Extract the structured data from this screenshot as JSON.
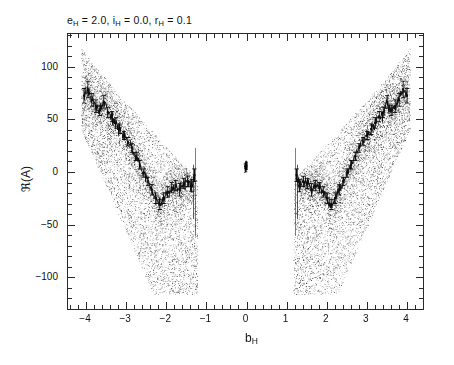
{
  "figure": {
    "title_plain": "e_H = 2.0, i_H = 0.0, r_H = 0.1",
    "background_color": "#ffffff",
    "frame_color": "#2a2a2a",
    "point_color": "#1a1a1a",
    "curve_color": "#111111"
  },
  "axes": {
    "x_title_plain": "b_H",
    "x_title_base": "b",
    "x_title_sub": "H",
    "y_title_plain": "R(A)",
    "y_title_symbol": "ℜ(A)",
    "x_ticks": [
      "-4",
      "-3",
      "-2",
      "-1",
      "0",
      "1",
      "2",
      "3",
      "4"
    ],
    "x_tick_values": [
      -4,
      -3,
      -2,
      -1,
      0,
      1,
      2,
      3,
      4
    ],
    "y_ticks": [
      "100",
      "50",
      "0",
      "-50",
      "-100"
    ],
    "y_tick_values": [
      100,
      50,
      0,
      -50,
      -100
    ],
    "x_minor_per_interval": 5,
    "y_minor_per_interval": 5,
    "xlim": [
      -4.45,
      4.45
    ],
    "ylim": [
      -132,
      131
    ],
    "grid": false,
    "ticks_direction": "in",
    "ticks_all_sides": true
  },
  "title_parts": {
    "e_base": "e",
    "e_sub": "H",
    "e_eq": " = 2.0, ",
    "i_base": "i",
    "i_sub": "H",
    "i_eq": " = 0.0, ",
    "r_base": "r",
    "r_sub": "H",
    "r_eq": " = 0.1"
  },
  "chart_data": {
    "type": "scatter",
    "xlabel": "b_H",
    "ylabel": "R(A)",
    "xlim": [
      -4.45,
      4.45
    ],
    "ylim": [
      -132,
      131
    ],
    "grid": false,
    "legend": null,
    "series": [
      {
        "name": "scatter-cloud-left",
        "type": "scatter",
        "x_range": [
          -4.12,
          -1.2
        ],
        "n_points": 2600,
        "envelope_note": "wedge: upper edge falls from +118 at b=-4.1 to about -8 at b=-1.25; lower edge falls from +40 at b=-4.1 to -118 at b=-2.2 then stays near -118 to -1.25"
      },
      {
        "name": "scatter-cloud-right",
        "type": "scatter",
        "x_range": [
          1.3,
          4.15
        ],
        "n_points": 2600,
        "envelope_note": "mirror image of scatter-cloud-left"
      },
      {
        "name": "central-cluster",
        "type": "scatter",
        "x_range": [
          -0.07,
          0.07
        ],
        "y_center": 5,
        "n_points": 140
      },
      {
        "name": "mean-curve-left",
        "type": "line-errorbar",
        "x": [
          -4.05,
          -3.95,
          -3.85,
          -3.75,
          -3.65,
          -3.55,
          -3.45,
          -3.35,
          -3.25,
          -3.15,
          -3.05,
          -2.95,
          -2.85,
          -2.75,
          -2.65,
          -2.55,
          -2.45,
          -2.35,
          -2.25,
          -2.15,
          -2.05,
          -1.95,
          -1.85,
          -1.75,
          -1.65,
          -1.55,
          -1.45,
          -1.35,
          -1.28
        ],
        "y": [
          72,
          78,
          68,
          62,
          58,
          66,
          56,
          52,
          46,
          40,
          34,
          28,
          22,
          14,
          6,
          -2,
          -10,
          -18,
          -26,
          -32,
          -26,
          -20,
          -16,
          -14,
          -18,
          -12,
          -10,
          -14,
          -4
        ],
        "yerr": [
          7,
          8,
          6,
          6,
          5,
          6,
          5,
          5,
          5,
          4,
          4,
          4,
          4,
          4,
          4,
          4,
          4,
          5,
          5,
          5,
          5,
          5,
          5,
          5,
          6,
          5,
          5,
          6,
          6
        ]
      },
      {
        "name": "mean-curve-right",
        "type": "line-errorbar",
        "x": [
          1.28,
          1.35,
          1.45,
          1.55,
          1.65,
          1.75,
          1.85,
          1.95,
          2.05,
          2.15,
          2.25,
          2.35,
          2.45,
          2.55,
          2.65,
          2.75,
          2.85,
          2.95,
          3.05,
          3.15,
          3.25,
          3.35,
          3.45,
          3.55,
          3.65,
          3.75,
          3.85,
          3.95,
          4.05
        ],
        "y": [
          -4,
          -14,
          -10,
          -12,
          -18,
          -14,
          -16,
          -20,
          -26,
          -32,
          -26,
          -18,
          -10,
          -2,
          6,
          14,
          22,
          28,
          34,
          40,
          46,
          52,
          56,
          66,
          58,
          62,
          68,
          78,
          72
        ],
        "yerr": [
          6,
          6,
          5,
          5,
          6,
          5,
          5,
          5,
          5,
          5,
          5,
          5,
          4,
          4,
          4,
          4,
          4,
          4,
          4,
          5,
          5,
          5,
          5,
          6,
          5,
          6,
          6,
          8,
          7
        ]
      }
    ]
  }
}
